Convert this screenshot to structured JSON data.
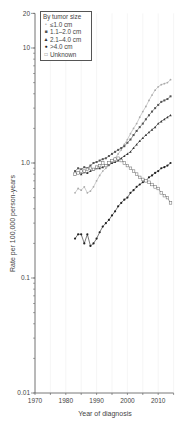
{
  "chart_data": {
    "type": "line",
    "title": "",
    "xlabel": "Year of diagnosis",
    "ylabel": "Rate per 100,000 person-years",
    "xlim": [
      1970,
      2015
    ],
    "ylim": [
      0.01,
      20
    ],
    "yscale": "log",
    "x_ticks": [
      1970,
      1980,
      1990,
      2000,
      2010
    ],
    "y_ticks": [
      0.01,
      0.1,
      1.0,
      10,
      20
    ],
    "y_tick_labels": [
      "0.01",
      "0.1",
      "1.0",
      "10",
      "20"
    ],
    "grid": "vertical light lines every 5 years",
    "legend": {
      "title": "By tumor size",
      "position": "upper left, boxed",
      "entries": [
        "≤1.0 cm",
        "1.1–2.0 cm",
        "2.1–4.0 cm",
        ">4.0 cm",
        "Unknown"
      ]
    },
    "x": [
      1983,
      1984,
      1985,
      1986,
      1987,
      1988,
      1989,
      1990,
      1991,
      1992,
      1993,
      1994,
      1995,
      1996,
      1997,
      1998,
      1999,
      2000,
      2001,
      2002,
      2003,
      2004,
      2005,
      2006,
      2007,
      2008,
      2009,
      2010,
      2011,
      2012,
      2013,
      2014
    ],
    "series": [
      {
        "name": "≤1.0 cm",
        "marker": "small light-gray dot",
        "color": "#aaaaaa",
        "values": [
          0.55,
          0.6,
          0.58,
          0.62,
          0.55,
          0.57,
          0.62,
          0.7,
          0.78,
          0.85,
          0.9,
          0.95,
          1.05,
          1.1,
          1.2,
          1.3,
          1.45,
          1.6,
          1.8,
          2.0,
          2.2,
          2.5,
          2.8,
          3.1,
          3.5,
          3.9,
          4.3,
          4.6,
          4.8,
          4.9,
          5.0,
          5.3
        ]
      },
      {
        "name": "1.1–2.0 cm",
        "marker": "filled square",
        "color": "#555555",
        "values": [
          0.85,
          0.9,
          0.88,
          0.92,
          0.9,
          0.95,
          1.0,
          1.02,
          1.05,
          1.08,
          1.1,
          1.15,
          1.2,
          1.25,
          1.3,
          1.35,
          1.4,
          1.5,
          1.6,
          1.75,
          1.9,
          2.05,
          2.2,
          2.4,
          2.6,
          2.8,
          3.0,
          3.2,
          3.4,
          3.5,
          3.6,
          3.8
        ]
      },
      {
        "name": "2.1–4.0 cm",
        "marker": "filled triangle",
        "color": "#333333",
        "values": [
          0.8,
          0.82,
          0.8,
          0.83,
          0.82,
          0.85,
          0.87,
          0.9,
          0.9,
          0.92,
          0.95,
          0.97,
          1.0,
          1.02,
          1.05,
          1.1,
          1.15,
          1.2,
          1.25,
          1.35,
          1.45,
          1.55,
          1.65,
          1.75,
          1.85,
          1.95,
          2.05,
          2.2,
          2.3,
          2.4,
          2.5,
          2.6
        ]
      },
      {
        "name": ">4.0 cm",
        "marker": "filled circle",
        "color": "#222222",
        "values": [
          0.22,
          0.24,
          0.24,
          0.2,
          0.24,
          0.19,
          0.2,
          0.22,
          0.25,
          0.28,
          0.3,
          0.32,
          0.35,
          0.38,
          0.42,
          0.45,
          0.48,
          0.5,
          0.55,
          0.58,
          0.62,
          0.65,
          0.68,
          0.7,
          0.75,
          0.78,
          0.82,
          0.85,
          0.9,
          0.92,
          0.95,
          1.0
        ]
      },
      {
        "name": "Unknown",
        "marker": "open square",
        "color": "#666666",
        "values": [
          0.8,
          0.82,
          0.85,
          0.85,
          0.88,
          0.9,
          0.88,
          0.92,
          0.95,
          1.0,
          0.95,
          1.0,
          1.05,
          1.08,
          1.1,
          1.05,
          1.0,
          0.95,
          0.9,
          0.85,
          0.8,
          0.75,
          0.72,
          0.7,
          0.68,
          0.65,
          0.62,
          0.6,
          0.55,
          0.52,
          0.5,
          0.45
        ]
      }
    ]
  }
}
